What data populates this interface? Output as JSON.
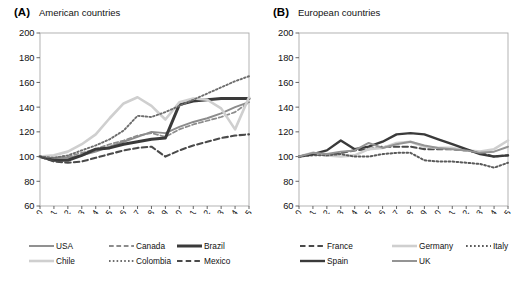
{
  "figure": {
    "panels": [
      {
        "letter": "(A)",
        "title": "American countries",
        "legend_rows": [
          [
            "USA",
            "Canada",
            "Brazil"
          ],
          [
            "Chile",
            "Colombia",
            "Mexico"
          ]
        ]
      },
      {
        "letter": "(B)",
        "title": "European countries",
        "legend_rows": [
          [
            "France",
            "Germany",
            "Italy"
          ],
          [
            "Spain",
            "UK"
          ]
        ]
      }
    ]
  },
  "chart_data": [
    {
      "type": "line",
      "title": "American countries",
      "panel_label": "(A)",
      "xlabel": "",
      "ylabel": "",
      "x": [
        2000,
        2001,
        2002,
        2003,
        2004,
        2005,
        2006,
        2007,
        2008,
        2009,
        2010,
        2011,
        2012,
        2013,
        2014,
        2015
      ],
      "xticklabels": [
        "2000",
        "2001",
        "2002",
        "2003",
        "2004",
        "2005",
        "2006",
        "2007",
        "2008",
        "2009",
        "2010",
        "2011",
        "2012",
        "2013",
        "2014",
        "2015"
      ],
      "yticks": [
        60,
        80,
        100,
        120,
        140,
        160,
        180,
        200
      ],
      "ylim": [
        60,
        200
      ],
      "grid": false,
      "legend_position": "below",
      "series": [
        {
          "name": "USA",
          "style": "solid",
          "color": "#8c8c8c",
          "width": 1.9,
          "values": [
            100,
            99,
            99,
            101,
            104,
            108,
            112,
            116,
            120,
            119,
            124,
            128,
            131,
            135,
            140,
            144
          ]
        },
        {
          "name": "Canada",
          "style": "dashed",
          "color": "#8c8c8c",
          "width": 1.7,
          "values": [
            100,
            99,
            100,
            103,
            106,
            110,
            113,
            117,
            119,
            116,
            122,
            126,
            129,
            132,
            136,
            144
          ]
        },
        {
          "name": "Brazil",
          "style": "solid",
          "color": "#3a3a3a",
          "width": 3.0,
          "values": [
            100,
            97,
            97,
            101,
            106,
            107,
            110,
            112,
            114,
            115,
            142,
            145,
            146,
            147,
            147,
            147
          ]
        },
        {
          "name": "Chile",
          "style": "solid",
          "color": "#cfcfcf",
          "width": 2.6,
          "values": [
            100,
            101,
            104,
            110,
            118,
            131,
            143,
            148,
            141,
            130,
            144,
            147,
            146,
            139,
            122,
            148
          ]
        },
        {
          "name": "Colombia",
          "style": "dotted",
          "color": "#6e6e6e",
          "width": 1.9,
          "values": [
            100,
            99,
            101,
            105,
            109,
            114,
            121,
            133,
            132,
            136,
            141,
            146,
            151,
            156,
            161,
            165
          ]
        },
        {
          "name": "Mexico",
          "style": "dashed",
          "color": "#4a4a4a",
          "width": 2.1,
          "values": [
            100,
            96,
            95,
            96,
            99,
            102,
            105,
            107,
            108,
            100,
            105,
            109,
            112,
            115,
            117,
            118
          ]
        }
      ]
    },
    {
      "type": "line",
      "title": "European countries",
      "panel_label": "(B)",
      "xlabel": "",
      "ylabel": "",
      "x": [
        2000,
        2001,
        2002,
        2003,
        2004,
        2005,
        2006,
        2007,
        2008,
        2009,
        2010,
        2011,
        2012,
        2013,
        2014,
        2015
      ],
      "xticklabels": [
        "2000",
        "2001",
        "2002",
        "2003",
        "2004",
        "2005",
        "2006",
        "2007",
        "2008",
        "2009",
        "2010",
        "2011",
        "2012",
        "2013",
        "2014",
        "2015"
      ],
      "yticks": [
        60,
        80,
        100,
        120,
        140,
        160,
        180,
        200
      ],
      "ylim": [
        60,
        200
      ],
      "grid": false,
      "legend_position": "below",
      "series": [
        {
          "name": "France",
          "style": "dashed",
          "color": "#4a4a4a",
          "width": 2.1,
          "values": [
            100,
            102,
            101,
            103,
            105,
            106,
            108,
            108,
            108,
            106,
            106,
            106,
            105,
            103,
            100,
            101
          ]
        },
        {
          "name": "Germany",
          "style": "solid",
          "color": "#cfcfcf",
          "width": 2.6,
          "values": [
            100,
            103,
            101,
            100,
            101,
            106,
            107,
            111,
            112,
            108,
            107,
            107,
            105,
            104,
            106,
            113
          ]
        },
        {
          "name": "Italy",
          "style": "dotted",
          "color": "#5a5a5a",
          "width": 2.0,
          "values": [
            100,
            101,
            101,
            102,
            100,
            100,
            102,
            103,
            103,
            97,
            96,
            96,
            95,
            94,
            91,
            95
          ]
        },
        {
          "name": "Spain",
          "style": "solid",
          "color": "#3a3a3a",
          "width": 2.4,
          "values": [
            100,
            102,
            105,
            113,
            106,
            108,
            112,
            118,
            119,
            118,
            114,
            110,
            106,
            102,
            100,
            101
          ]
        },
        {
          "name": "UK",
          "style": "solid",
          "color": "#949494",
          "width": 2.0,
          "values": [
            100,
            103,
            102,
            104,
            105,
            111,
            107,
            110,
            112,
            109,
            107,
            106,
            105,
            103,
            104,
            108
          ]
        }
      ]
    }
  ]
}
